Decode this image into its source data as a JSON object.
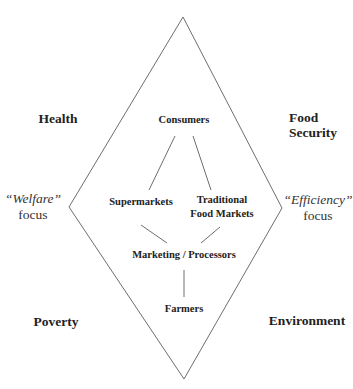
{
  "diagram": {
    "shape": "diamond",
    "line_color": "#6e6e6e",
    "outer_corners": {
      "top_left": "Health",
      "top_right": [
        "Food",
        "Security"
      ],
      "bottom_left": "Poverty",
      "bottom_right": "Environment"
    },
    "side_labels": {
      "left": {
        "emphasis": "“Welfare”",
        "word": "focus"
      },
      "right": {
        "emphasis": "“Efficiency”",
        "word": "focus"
      }
    },
    "nodes": {
      "consumers": "Consumers",
      "supermarkets": "Supermarkets",
      "traditional": [
        "Traditional",
        "Food Markets"
      ],
      "processors": "Marketing / Processors",
      "farmers": "Farmers"
    },
    "edges": [
      [
        "Consumers",
        "Supermarkets"
      ],
      [
        "Consumers",
        "Traditional Food Markets"
      ],
      [
        "Supermarkets",
        "Marketing / Processors"
      ],
      [
        "Traditional Food Markets",
        "Marketing / Processors"
      ],
      [
        "Marketing / Processors",
        "Farmers"
      ]
    ]
  }
}
